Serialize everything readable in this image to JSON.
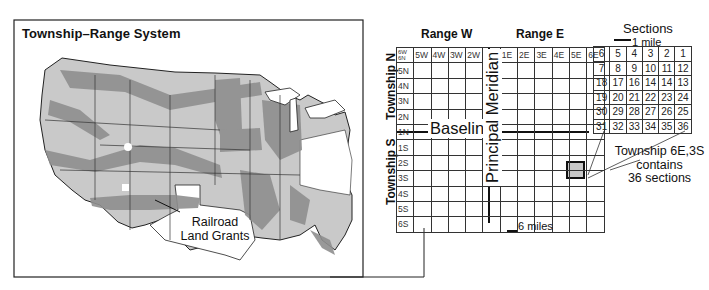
{
  "map": {
    "title": "Township–Range System",
    "annotation": [
      "Railroad",
      "Land Grants"
    ],
    "colors": {
      "land": "#c9c9c9",
      "grants": "#8f8f8f",
      "water": "#ffffff",
      "border": "#222222"
    }
  },
  "grid": {
    "range_west_label": "Range W",
    "range_east_label": "Range E",
    "township_north_label": "Township N",
    "township_south_label": "Township S",
    "corner_label_top": "6W",
    "corner_label_bottom": "6N",
    "west_columns": [
      "5W",
      "4W",
      "3W",
      "2W",
      "1W"
    ],
    "east_columns": [
      "1E",
      "2E",
      "3E",
      "4E",
      "5E",
      "6E"
    ],
    "north_rows": [
      "5N",
      "4N",
      "3N",
      "2N",
      "1N"
    ],
    "south_rows": [
      "1S",
      "2S",
      "3S",
      "4S",
      "5S",
      "6S"
    ],
    "baseline_label": "Baseline",
    "meridian_label": "Principal Meridian",
    "scale_label": "6 miles",
    "highlight_color": "#c8c8c8"
  },
  "sections": {
    "title": "Sections",
    "scale_label": "1 mile",
    "rows": [
      [
        "6",
        "5",
        "4",
        "3",
        "2",
        "1"
      ],
      [
        "7",
        "8",
        "9",
        "10",
        "11",
        "12"
      ],
      [
        "18",
        "17",
        "16",
        "14",
        "14",
        "13"
      ],
      [
        "19",
        "20",
        "21",
        "22",
        "23",
        "24"
      ],
      [
        "30",
        "29",
        "28",
        "27",
        "26",
        "25"
      ],
      [
        "31",
        "32",
        "33",
        "34",
        "35",
        "36"
      ]
    ],
    "callout": [
      "Township 6E,3S",
      "contains",
      "36 sections"
    ]
  }
}
